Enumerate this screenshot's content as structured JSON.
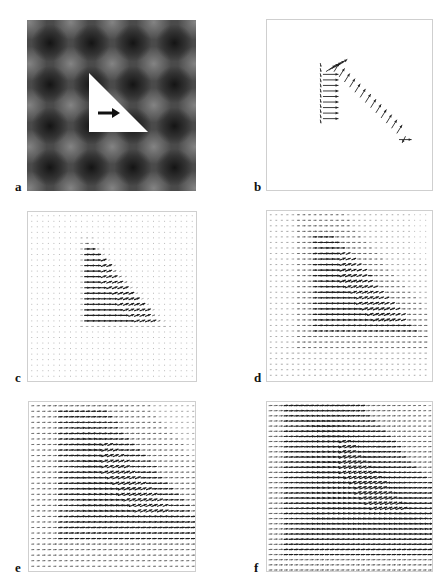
{
  "figure": {
    "header_text": "",
    "panels": [
      {
        "id": "a",
        "label": "a",
        "kind": "stimulus",
        "box": [
          27,
          20,
          169,
          171
        ],
        "label_pos": [
          15,
          180
        ],
        "description": "Gray checker-like blurred grid background with white right triangle and black rightward arrow",
        "background": {
          "base": "#4a4a4a",
          "blob_color": "#141414",
          "light_color": "#8a8a8a",
          "period": 41.5,
          "offset": [
            23,
            23
          ]
        },
        "triangle": {
          "points": [
            [
              62,
              53
            ],
            [
              62,
              112
            ],
            [
              121,
              112
            ]
          ],
          "fill": "#ffffff"
        },
        "arrow": {
          "x1": 71,
          "y1": 93,
          "x2": 93,
          "y2": 93,
          "color": "#111111"
        }
      },
      {
        "id": "b",
        "label": "b",
        "kind": "sparse-vector-field",
        "box": [
          266,
          19,
          167,
          172
        ],
        "label_pos": [
          254,
          180
        ],
        "description": "Sparse motion vectors along triangle edges"
      },
      {
        "id": "c",
        "label": "c",
        "kind": "dense-vector-field",
        "box": [
          27,
          211,
          170,
          171
        ],
        "label_pos": [
          15,
          371
        ],
        "grid_step": 5.6,
        "spread": 0.0,
        "description": "Vectors concentrated in triangle region"
      },
      {
        "id": "d",
        "label": "d",
        "kind": "dense-vector-field",
        "box": [
          266,
          210,
          167,
          172
        ],
        "label_pos": [
          254,
          371
        ],
        "grid_step": 5.6,
        "spread": 0.35,
        "description": "Vector field diffusing outward"
      },
      {
        "id": "e",
        "label": "e",
        "kind": "dense-vector-field",
        "box": [
          28,
          401,
          168,
          171
        ],
        "label_pos": [
          15,
          561
        ],
        "grid_step": 5.6,
        "spread": 0.7,
        "description": "Vector field spread over most of frame"
      },
      {
        "id": "f",
        "label": "f",
        "kind": "dense-vector-field",
        "box": [
          266,
          401,
          167,
          171
        ],
        "label_pos": [
          254,
          561
        ],
        "grid_step": 5.2,
        "spread": 1.0,
        "description": "Vector field filling entire frame"
      }
    ]
  },
  "colors": {
    "frame": "#cfcfcf",
    "arrow": "#222222",
    "dot": "#9a9a9a"
  }
}
